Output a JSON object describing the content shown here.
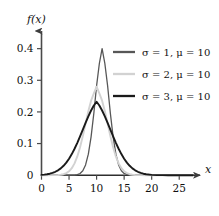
{
  "chart_data": {
    "type": "line",
    "title": "",
    "subtitle": "",
    "xlabel": "x",
    "ylabel": "f(x)",
    "xlim": [
      0,
      27.5
    ],
    "ylim": [
      0,
      0.44
    ],
    "xticks": [
      "0",
      "5",
      "10",
      "15",
      "20",
      "25"
    ],
    "xtick_values": [
      0,
      5,
      10,
      15,
      20,
      25
    ],
    "yticks": [
      "0",
      "0.1",
      "0.2",
      "0.3",
      "0.4"
    ],
    "ytick_values": [
      0,
      0.1,
      0.2,
      0.3,
      0.4
    ],
    "grid": false,
    "legend_position": "upper-right-inside",
    "axis_arrows": true,
    "series": [
      {
        "name": "σ = 1, μ = 10",
        "sigma": 1,
        "mu": 10,
        "peak_value": 0.4,
        "color": "#575757",
        "linewidth": 1.3,
        "x": [
          0,
          1,
          2,
          3,
          4,
          5,
          5.5,
          6,
          6.5,
          7,
          7.5,
          8,
          8.5,
          9,
          9.5,
          10,
          10.5,
          11,
          11.5,
          12,
          12.5,
          13,
          13.5,
          14,
          14.5,
          15,
          16,
          17,
          18,
          19,
          20,
          22,
          24,
          26,
          27.5
        ],
        "y": [
          0,
          0,
          0,
          0,
          0,
          0,
          0.0001,
          0.0005,
          0.0018,
          0.0054,
          0.0139,
          0.0323,
          0.0664,
          0.121,
          0.1953,
          0.2821,
          0.3521,
          0.3989,
          0.3521,
          0.2821,
          0.1953,
          0.121,
          0.0664,
          0.0323,
          0.0139,
          0.0054,
          0.0005,
          0.0001,
          0,
          0,
          0,
          0,
          0,
          0,
          0
        ]
      },
      {
        "name": "σ = 2, μ = 10",
        "sigma": 2,
        "mu": 10,
        "peak_value": 0.28,
        "color": "#d2d2d2",
        "linewidth": 1.9,
        "x": [
          0,
          1,
          2,
          3,
          3.5,
          4,
          4.5,
          5,
          5.5,
          6,
          6.5,
          7,
          7.5,
          8,
          8.5,
          9,
          9.5,
          10,
          10.5,
          11,
          11.5,
          12,
          12.5,
          13,
          13.5,
          14,
          14.5,
          15,
          15.5,
          16,
          16.5,
          17,
          18,
          19,
          20,
          22,
          24,
          26,
          27.5
        ],
        "y": [
          0,
          0,
          0.0001,
          0.0004,
          0.0009,
          0.0022,
          0.0046,
          0.0088,
          0.0158,
          0.0266,
          0.0422,
          0.0629,
          0.0882,
          0.1163,
          0.144,
          0.1679,
          0.1843,
          0.1995,
          0.1843,
          0.1679,
          0.144,
          0.1163,
          0.0882,
          0.0629,
          0.0422,
          0.0266,
          0.0158,
          0.0088,
          0.0046,
          0.0022,
          0.0009,
          0.0004,
          0.0001,
          0,
          0,
          0,
          0,
          0,
          0
        ]
      },
      {
        "name": "σ = 3, μ = 10",
        "sigma": 3,
        "mu": 10,
        "peak_value": 0.232,
        "color": "#1a1a1a",
        "linewidth": 1.9,
        "x": [
          0,
          0.5,
          1,
          1.5,
          2,
          2.5,
          3,
          3.5,
          4,
          4.5,
          5,
          5.5,
          6,
          6.5,
          7,
          7.5,
          8,
          8.5,
          9,
          9.5,
          10,
          10.5,
          11,
          11.5,
          12,
          12.5,
          13,
          13.5,
          14,
          14.5,
          15,
          15.5,
          16,
          16.5,
          17,
          17.5,
          18,
          18.5,
          19,
          20,
          21,
          22,
          23,
          24,
          25,
          26,
          27.5
        ],
        "y": [
          0.0005,
          0.0009,
          0.0015,
          0.0024,
          0.0037,
          0.0055,
          0.0079,
          0.011,
          0.0151,
          0.0202,
          0.0265,
          0.0339,
          0.0425,
          0.0521,
          0.0625,
          0.0733,
          0.0841,
          0.0945,
          0.104,
          0.112,
          0.118,
          0.112,
          0.104,
          0.0945,
          0.0841,
          0.0733,
          0.0625,
          0.0521,
          0.0425,
          0.0339,
          0.0265,
          0.0202,
          0.0151,
          0.011,
          0.0079,
          0.0055,
          0.0037,
          0.0024,
          0.0015,
          0.0005,
          0.0002,
          0.0001,
          0,
          0,
          0,
          0,
          0
        ]
      }
    ],
    "legend_entries": [
      {
        "label": "σ = 1, μ = 10",
        "color": "#575757"
      },
      {
        "label": "σ = 2, μ = 10",
        "color": "#d2d2d2"
      },
      {
        "label": "σ = 3, μ = 10",
        "color": "#1a1a1a"
      }
    ],
    "colors": {
      "axis": "#4a4a4a",
      "text": "#101010",
      "background": "#ffffff"
    }
  }
}
